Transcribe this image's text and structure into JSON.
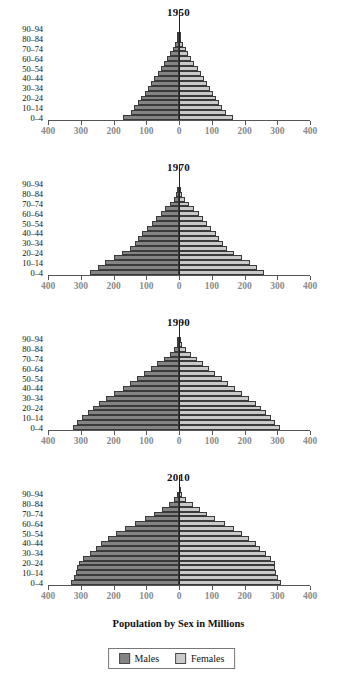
{
  "figure": {
    "axis_caption": "Population by Sex in Millions",
    "colors": {
      "male": "#848484",
      "female": "#c9c9c9",
      "axis": "#555555",
      "tick_label": "#8a8a8a"
    }
  },
  "legend": {
    "position": "bottom-center",
    "items": [
      {
        "label": "Males",
        "color": "#848484",
        "swatch": "male-swatch"
      },
      {
        "label": "Females",
        "color": "#c9c9c9",
        "swatch": "female-swatch"
      }
    ]
  },
  "axis": {
    "x_tick_labels": [
      "400",
      "300",
      "200",
      "100",
      "0",
      "100",
      "200",
      "300",
      "400"
    ],
    "x_tick_values": [
      -400,
      -300,
      -200,
      -100,
      0,
      100,
      200,
      300,
      400
    ],
    "y_tick_labels": [
      "90–94",
      "80–84",
      "70–74",
      "60–64",
      "50–54",
      "40–44",
      "30–34",
      "20–24",
      "10–14",
      "0–4"
    ],
    "age_groups": [
      "0–4",
      "5–9",
      "10–14",
      "15–19",
      "20–24",
      "25–29",
      "30–34",
      "35–39",
      "40–44",
      "45–49",
      "50–54",
      "55–59",
      "60–64",
      "65–69",
      "70–74",
      "75–79",
      "80–84",
      "85–89",
      "90–94",
      "95+"
    ]
  },
  "chart_data": {
    "type": "bar",
    "xlabel": "Population by Sex in Millions",
    "ylabel": "",
    "xlim": [
      -400,
      400
    ],
    "grid": false,
    "legend_position": "bottom-center",
    "categories": [
      "0–4",
      "5–9",
      "10–14",
      "15–19",
      "20–24",
      "25–29",
      "30–34",
      "35–39",
      "40–44",
      "45–49",
      "50–54",
      "55–59",
      "60–64",
      "65–69",
      "70–74",
      "75–79",
      "80–84",
      "85–89",
      "90–94",
      "95+"
    ],
    "panels": [
      {
        "title": "1950",
        "series": [
          {
            "name": "Males",
            "values": [
              172,
              148,
              136,
              124,
              115,
              104,
              95,
              85,
              75,
              65,
              55,
              45,
              36,
              27,
              19,
              11,
              6,
              2,
              1,
              0
            ]
          },
          {
            "name": "Females",
            "values": [
              166,
              143,
              131,
              121,
              113,
              103,
              94,
              85,
              76,
              66,
              57,
              47,
              38,
              29,
              21,
              13,
              7,
              3,
              1,
              0
            ]
          }
        ]
      },
      {
        "title": "1970",
        "series": [
          {
            "name": "Males",
            "values": [
              272,
              248,
              225,
              200,
              174,
              150,
              135,
              124,
              112,
              98,
              84,
              70,
              56,
              42,
              28,
              16,
              8,
              3,
              1,
              0
            ]
          },
          {
            "name": "Females",
            "values": [
              260,
              238,
              216,
              193,
              169,
              147,
              133,
              123,
              112,
              99,
              86,
              73,
              60,
              46,
              32,
              19,
              10,
              4,
              1,
              0
            ]
          }
        ]
      },
      {
        "title": "1990",
        "series": [
          {
            "name": "Males",
            "values": [
              325,
              310,
              295,
              278,
              262,
              245,
              222,
              197,
              172,
              150,
              128,
              106,
              86,
              66,
              47,
              29,
              15,
              6,
              2,
              0
            ]
          },
          {
            "name": "Females",
            "values": [
              308,
              294,
              281,
              266,
              251,
              236,
              215,
              192,
              170,
              150,
              130,
              110,
              92,
              73,
              55,
              36,
              21,
              9,
              3,
              1
            ]
          }
        ]
      },
      {
        "title": "2010",
        "series": [
          {
            "name": "Males",
            "values": [
              330,
              322,
              315,
              310,
              305,
              292,
              272,
              252,
              238,
              216,
              192,
              164,
              133,
              103,
              76,
              52,
              31,
              15,
              5,
              1
            ]
          },
          {
            "name": "Females",
            "values": [
              310,
              303,
              297,
              293,
              292,
              282,
              265,
              248,
              235,
              215,
              193,
              167,
              139,
              111,
              86,
              63,
              42,
              22,
              9,
              2
            ]
          }
        ]
      }
    ]
  }
}
